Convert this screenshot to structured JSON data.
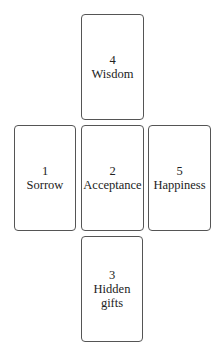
{
  "cards": [
    {
      "number": "1",
      "label": "Sorrow"
    },
    {
      "number": "2",
      "label": "Acceptance"
    },
    {
      "number": "3",
      "label": "Hidden gifts"
    },
    {
      "number": "4",
      "label": "Wisdom"
    },
    {
      "number": "5",
      "label": "Happiness"
    }
  ]
}
